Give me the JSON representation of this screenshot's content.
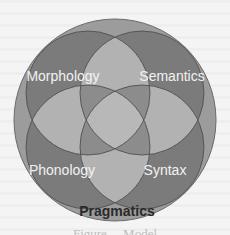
{
  "diagram": {
    "type": "venn",
    "outer": {
      "label": "Pragmatics",
      "color": "#9c9c9c"
    },
    "circles": [
      {
        "id": "morphology",
        "label": "Morphology",
        "position": "top-left"
      },
      {
        "id": "semantics",
        "label": "Semantics",
        "position": "top-right"
      },
      {
        "id": "phonology",
        "label": "Phonology",
        "position": "bottom-left"
      },
      {
        "id": "syntax",
        "label": "Syntax",
        "position": "bottom-right"
      }
    ],
    "colors": {
      "inner_circle": "#7b7b7b",
      "pair_overlap": "#b2b2b2",
      "center_overlap": "#8c8c8c",
      "stroke": "#505050",
      "label_inner": "#f2f2f2",
      "label_outer": "#2a2a2a"
    },
    "caption": "Figure ... Model"
  }
}
